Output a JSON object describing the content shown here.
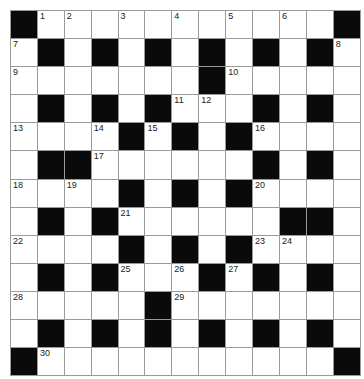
{
  "puzzle": {
    "rows": 13,
    "cols": 13,
    "colors": {
      "black": "#0a0a0a",
      "white": "#ffffff",
      "grid_line": "#9a9a9a"
    },
    "grid": [
      [
        "#",
        "1",
        "2",
        ".",
        "3",
        ".",
        "4",
        ".",
        "5",
        ".",
        "6",
        ".",
        "#"
      ],
      [
        "7",
        "#",
        ".",
        "#",
        ".",
        "#",
        ".",
        "#",
        ".",
        "#",
        ".",
        "#",
        "8"
      ],
      [
        "9",
        ".",
        ".",
        ".",
        ".",
        ".",
        ".",
        "#",
        "10",
        ".",
        ".",
        ".",
        "."
      ],
      [
        ".",
        "#",
        ".",
        "#",
        ".",
        "#",
        "11",
        "12",
        ".",
        "#",
        ".",
        "#",
        "."
      ],
      [
        "13",
        ".",
        ".",
        "14",
        "#",
        "15",
        "#",
        ".",
        "#",
        "16",
        ".",
        ".",
        "."
      ],
      [
        ".",
        "#",
        "#",
        "17",
        ".",
        ".",
        ".",
        ".",
        ".",
        "#",
        ".",
        "#",
        "."
      ],
      [
        "18",
        ".",
        "19",
        ".",
        "#",
        ".",
        "#",
        ".",
        "#",
        "20",
        ".",
        ".",
        "."
      ],
      [
        ".",
        "#",
        ".",
        "#",
        "21",
        ".",
        ".",
        ".",
        ".",
        ".",
        "#",
        "#",
        "."
      ],
      [
        "22",
        ".",
        ".",
        ".",
        "#",
        ".",
        "#",
        ".",
        "#",
        "23",
        "24",
        ".",
        "."
      ],
      [
        ".",
        "#",
        ".",
        "#",
        "25",
        ".",
        "26",
        "#",
        "27",
        "#",
        ".",
        "#",
        "."
      ],
      [
        "28",
        ".",
        ".",
        ".",
        ".",
        "#",
        "29",
        ".",
        ".",
        ".",
        ".",
        ".",
        "."
      ],
      [
        ".",
        "#",
        ".",
        "#",
        ".",
        "#",
        ".",
        "#",
        ".",
        "#",
        ".",
        "#",
        "."
      ],
      [
        "#",
        "30",
        ".",
        ".",
        ".",
        ".",
        ".",
        ".",
        ".",
        ".",
        ".",
        ".",
        "#"
      ]
    ]
  }
}
